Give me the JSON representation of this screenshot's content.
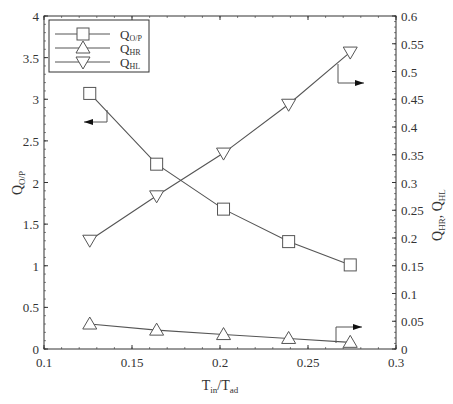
{
  "chart_data": {
    "type": "line",
    "title": "",
    "xlabel": "T_in/T_ad",
    "xlabel_main": "T",
    "xlabel_sub1": "in",
    "xlabel_mid": "/T",
    "xlabel_sub2": "ad",
    "ylabel_left": "Q_O/P",
    "ylabel_left_main": "Q",
    "ylabel_left_sub": "O/P",
    "ylabel_right": "Q_HR, Q_HL",
    "ylabel_right_q1": "Q",
    "ylabel_right_sub1": "HR",
    "ylabel_right_sep": ", Q",
    "ylabel_right_sub2": "HL",
    "xlim": [
      0.1,
      0.3
    ],
    "ylim_left": [
      0,
      4
    ],
    "ylim_right": [
      0,
      0.6
    ],
    "x_ticks": [
      "0.1",
      "0.15",
      "0.2",
      "0.25",
      "0.3"
    ],
    "y_left_ticks": [
      "0",
      "0.5",
      "1",
      "1.5",
      "2",
      "2.5",
      "3",
      "3.5",
      "4"
    ],
    "y_right_ticks": [
      "0",
      "0.05",
      "0.1",
      "0.15",
      "0.2",
      "0.25",
      "0.3",
      "0.35",
      "0.4",
      "0.45",
      "0.5",
      "0.55",
      "0.6"
    ],
    "grid": false,
    "legend_position": "upper left",
    "x": [
      0.126,
      0.164,
      0.202,
      0.239,
      0.274
    ],
    "series": [
      {
        "name": "Q_O/P",
        "label_main": "Q",
        "label_sub": "O/P",
        "marker": "square",
        "axis": "left",
        "values": [
          3.07,
          2.22,
          1.68,
          1.29,
          1.01
        ]
      },
      {
        "name": "Q_HR",
        "label_main": "Q",
        "label_sub": "HR",
        "marker": "triangle-up",
        "axis": "right",
        "values": [
          0.045,
          0.034,
          0.026,
          0.019,
          0.012
        ]
      },
      {
        "name": "Q_HL",
        "label_main": "Q",
        "label_sub": "HL",
        "marker": "triangle-down",
        "axis": "right",
        "values": [
          0.196,
          0.276,
          0.353,
          0.441,
          0.535
        ]
      }
    ],
    "annotations": [
      {
        "type": "axis-arrow",
        "series": "Q_O/P",
        "direction": "left"
      },
      {
        "type": "axis-arrow",
        "series": "Q_HL",
        "direction": "right"
      },
      {
        "type": "axis-arrow",
        "series": "Q_HR",
        "direction": "right"
      }
    ]
  },
  "colors": {
    "line": "#555555",
    "axis": "#333333",
    "marker_fill": "#ffffff",
    "arrow": "#111111"
  }
}
